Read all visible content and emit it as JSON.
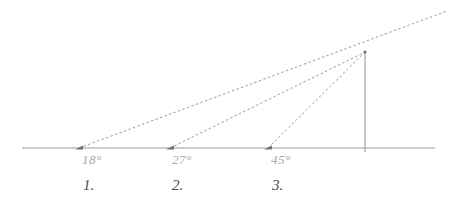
{
  "figure": {
    "type": "geometry-diagram",
    "background_color": "#ffffff",
    "baseline_color": "#9a9a9a",
    "ray_color": "#8d8d93",
    "vertical_color": "#9a9a9a",
    "angle_label_color": "#a8a8a8",
    "index_label_color": "#4a4a4a"
  },
  "chart_data": {
    "type": "scatter",
    "title": "",
    "xlabel": "",
    "ylabel": "",
    "grid": false,
    "legend": null,
    "apex": {
      "x": 365,
      "y": 52
    },
    "baseline": {
      "y": 148,
      "x_start": 22,
      "x_end": 435
    },
    "vertical_drop": {
      "x": 365,
      "y_top": 52,
      "y_bottom": 148
    },
    "series": [
      {
        "name": "ray-18",
        "angle_deg": 18,
        "angle_label": "18°",
        "index_label": "1.",
        "vertex": {
          "x": 79,
          "y": 148
        },
        "extends_past_apex": true,
        "extension_end": {
          "x": 447,
          "y": 11
        }
      },
      {
        "name": "ray-27",
        "angle_deg": 27,
        "angle_label": "27°",
        "index_label": "2.",
        "vertex": {
          "x": 170,
          "y": 148
        },
        "extends_past_apex": false,
        "extension_end": null
      },
      {
        "name": "ray-45",
        "angle_deg": 45,
        "angle_label": "45°",
        "index_label": "3.",
        "vertex": {
          "x": 268,
          "y": 148
        },
        "extends_past_apex": false,
        "extension_end": null
      }
    ]
  },
  "labels": {
    "angles": [
      {
        "text": "18°",
        "x": 82,
        "y": 152
      },
      {
        "text": "27°",
        "x": 172,
        "y": 152
      },
      {
        "text": "45°",
        "x": 271,
        "y": 152
      }
    ],
    "indices": [
      {
        "text": "1.",
        "x": 83,
        "y": 177
      },
      {
        "text": "2.",
        "x": 172,
        "y": 177
      },
      {
        "text": "3.",
        "x": 272,
        "y": 177
      }
    ]
  }
}
